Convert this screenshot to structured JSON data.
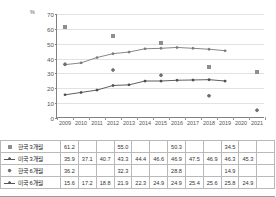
{
  "chart_data": {
    "type": "line",
    "title": "",
    "xlabel": "",
    "ylabel": "%",
    "ylim": [
      0,
      70
    ],
    "ytick_step": 10,
    "yticks": [
      "0",
      "10",
      "20",
      "30",
      "40",
      "50",
      "60",
      "70"
    ],
    "grid": true,
    "legend_position": "table-left",
    "categories": [
      "2009",
      "2010",
      "2011",
      "2012",
      "2013",
      "2014",
      "2015",
      "2016",
      "2017",
      "2018",
      "2019",
      "2020",
      "2021"
    ],
    "series": [
      {
        "name": "한국 3개월",
        "marker": "square",
        "line": false,
        "color": "#8e8e8e",
        "values": [
          61.2,
          null,
          null,
          55.0,
          null,
          null,
          50.3,
          null,
          null,
          34.5,
          null,
          null,
          30.9
        ]
      },
      {
        "name": "미국 3개월",
        "marker": "diamond",
        "line": true,
        "color": "#7a7a7a",
        "values": [
          35.9,
          37.1,
          40.7,
          43.3,
          44.4,
          46.6,
          46.9,
          47.5,
          46.9,
          46.3,
          45.3,
          null,
          null
        ]
      },
      {
        "name": "한국 6개월",
        "marker": "diamond",
        "line": false,
        "color": "#6f6f6f",
        "values": [
          36.2,
          null,
          null,
          32.3,
          null,
          null,
          28.8,
          null,
          null,
          14.9,
          null,
          null,
          5.2
        ]
      },
      {
        "name": "미국 6개월",
        "marker": "diamond",
        "line": true,
        "color": "#4d4d4d",
        "values": [
          15.6,
          17.2,
          18.8,
          21.9,
          22.3,
          24.9,
          24.9,
          25.4,
          25.6,
          25.8,
          24.9,
          null,
          null
        ]
      }
    ]
  },
  "table": {
    "columns": [
      "2009",
      "2010",
      "2011",
      "2012",
      "2013",
      "2014",
      "2015",
      "2016",
      "2017",
      "2018",
      "2019",
      "2020",
      "2021"
    ],
    "rows": [
      {
        "label": "한국 3개월",
        "marker": "square",
        "has_line": false,
        "cells": [
          "61.2",
          "",
          "",
          "55.0",
          "",
          "",
          "50.3",
          "",
          "",
          "34.5",
          "",
          "",
          "30.9"
        ]
      },
      {
        "label": "미국 3개월",
        "marker": "diamond",
        "has_line": true,
        "cells": [
          "35.9",
          "37.1",
          "40.7",
          "43.3",
          "44.4",
          "46.6",
          "46.9",
          "47.5",
          "46.9",
          "46.3",
          "45.3",
          "",
          ""
        ]
      },
      {
        "label": "한국 6개월",
        "marker": "diamond-solid",
        "has_line": false,
        "cells": [
          "36.2",
          "",
          "",
          "32.3",
          "",
          "",
          "28.8",
          "",
          "",
          "14.9",
          "",
          "",
          "5.2"
        ]
      },
      {
        "label": "미국 6개월",
        "marker": "diamond",
        "has_line": true,
        "cells": [
          "15.6",
          "17.2",
          "18.8",
          "21.9",
          "22.3",
          "24.9",
          "24.9",
          "25.4",
          "25.6",
          "25.8",
          "24.9",
          "",
          ""
        ]
      }
    ]
  },
  "colors": {
    "axis": "#808080",
    "grid": "#e2e2e2",
    "korea_3m": "#8e8e8e",
    "us_3m": "#7a7a7a",
    "korea_6m": "#6f6f6f",
    "us_6m": "#4d4d4d"
  }
}
